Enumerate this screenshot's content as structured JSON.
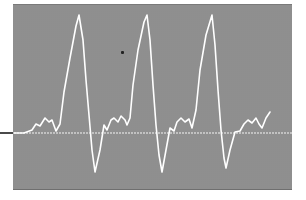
{
  "image": {
    "subject": "oscilloscope waveform trace",
    "colors": {
      "screen_background": "#a9a9a9",
      "trace": "#ffffff",
      "baseline": "#f4f4f4",
      "page_background": "#ffffff",
      "left_marker": "#4a4a4a"
    },
    "baseline_y": 133,
    "trace_points": "14,133 24,133 32,130 36,124 40,126 45,118 49,122 52,120 56,131 60,124 64,92 70,58 76,26 79,15 83,40 86,80 89,115 92,150 95,172 100,150 104,125 107,130 111,120 114,118 118,122 121,116 125,120 127,125 130,118 133,85 138,50 144,22 147,15 150,40 153,85 156,125 159,155 162,172 166,150 170,128 174,131 177,122 181,118 185,122 189,119 192,128 196,110 200,70 206,35 212,15 215,45 218,90 221,130 224,158 226,168 230,150 235,132 240,131 244,124 248,120 252,123 256,118 259,124 262,128 266,118 270,112"
  }
}
